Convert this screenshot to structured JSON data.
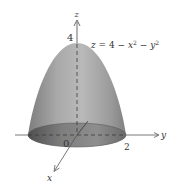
{
  "figure": {
    "equation": {
      "lhs": "z",
      "eq": " = 4 − ",
      "x": "x",
      "x_exp": "2",
      "minus": " − ",
      "y": "y",
      "y_exp": "2"
    },
    "axes": {
      "z_label": "z",
      "y_label": "y",
      "x_label": "x",
      "origin_label": "0",
      "z_tick": "4",
      "y_tick": "2"
    },
    "colors": {
      "surface_light": "#b5b5b5",
      "surface_dark": "#7a7a7a",
      "base_ellipse": "#8a8a8a",
      "base_ellipse_dark": "#5e5e5e",
      "axis": "#444444"
    }
  }
}
